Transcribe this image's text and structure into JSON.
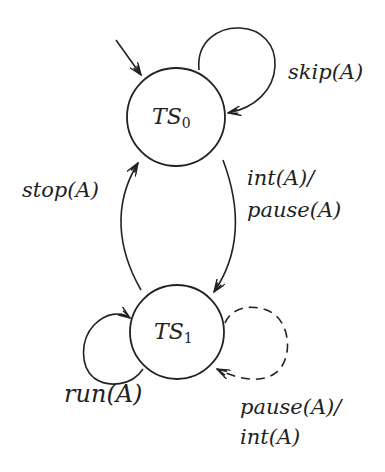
{
  "diagram": {
    "type": "state-transition",
    "colors": {
      "stroke": "#222222",
      "background": "#ffffff"
    },
    "states": [
      {
        "id": "TS0",
        "name": "TS",
        "subscript": "0",
        "initial": true
      },
      {
        "id": "TS1",
        "name": "TS",
        "subscript": "1",
        "initial": false
      }
    ],
    "transitions": [
      {
        "from": "TS0",
        "to": "TS0",
        "label": "skip(A)",
        "style": "solid"
      },
      {
        "from": "TS0",
        "to": "TS1",
        "label_line1": "int(A)/",
        "label_line2": "pause(A)",
        "style": "solid"
      },
      {
        "from": "TS1",
        "to": "TS0",
        "label": "stop(A)",
        "style": "solid"
      },
      {
        "from": "TS1",
        "to": "TS1",
        "label": "run(A)",
        "style": "solid"
      },
      {
        "from": "TS1",
        "to": "TS1",
        "label_line1": "pause(A)/",
        "label_line2": "int(A)",
        "style": "dashed"
      }
    ]
  }
}
